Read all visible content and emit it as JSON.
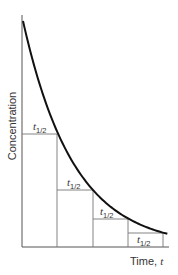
{
  "chart_data": {
    "type": "line",
    "title": "",
    "xlabel": "Time, t",
    "ylabel": "Concentration",
    "x": [
      0,
      1,
      2,
      3,
      4,
      4.1
    ],
    "x_units": "half-lives",
    "values": [
      1.0,
      0.5,
      0.25,
      0.125,
      0.0625,
      0.0583
    ],
    "annotations": [
      "t1/2",
      "t1/2",
      "t1/2",
      "t1/2"
    ],
    "grid": false,
    "legend": "none"
  },
  "labels": {
    "y_axis": "Concentration",
    "x_axis_main": "Time, ",
    "x_axis_var": "t",
    "half_life_main": "t",
    "half_life_sub": "1/2"
  },
  "colors": {
    "curve": "#111111",
    "axis": "#555555",
    "guides": "#777777",
    "text": "#333333"
  }
}
